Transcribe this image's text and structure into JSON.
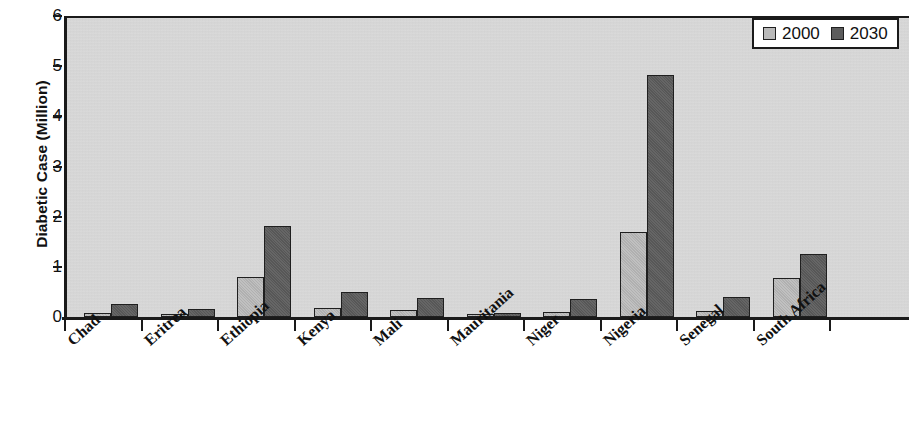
{
  "chart_data": {
    "type": "bar",
    "title": "",
    "subtitle": "",
    "xlabel": "",
    "ylabel": "Diabetic Case (Million)",
    "ylim": [
      0,
      6
    ],
    "ytick_labels": [
      "6",
      "5",
      "4",
      "3",
      "2",
      "1",
      "0"
    ],
    "ytick_values": [
      6,
      5,
      4,
      3,
      2,
      1,
      0
    ],
    "grid": false,
    "legend_position": "top-right",
    "categories": [
      "Chad",
      "Eritrea",
      "Ethiopia",
      "Kenya",
      "Mali",
      "Mauritania",
      "Niger",
      "Nigeria",
      "Senegal",
      "South Africa"
    ],
    "series": [
      {
        "name": "2000",
        "color": "#b9b9b9",
        "values": [
          0.08,
          0.05,
          0.8,
          0.18,
          0.14,
          0.03,
          0.1,
          1.7,
          0.12,
          0.78
        ]
      },
      {
        "name": "2030",
        "color": "#5c5c5c",
        "values": [
          0.26,
          0.15,
          1.82,
          0.5,
          0.37,
          0.09,
          0.36,
          4.82,
          0.39,
          1.26
        ]
      }
    ]
  },
  "legend": {
    "entries": [
      {
        "label": "2000",
        "swatch": "legend-swatch-2000"
      },
      {
        "label": "2030",
        "swatch": "legend-swatch-2030"
      }
    ]
  },
  "colors": {
    "series_2000": "#b9b9b9",
    "series_2030": "#5c5c5c",
    "plot_background": "#d9d9d9",
    "axis": "#1a1a1a",
    "page_background": "#ffffff"
  }
}
